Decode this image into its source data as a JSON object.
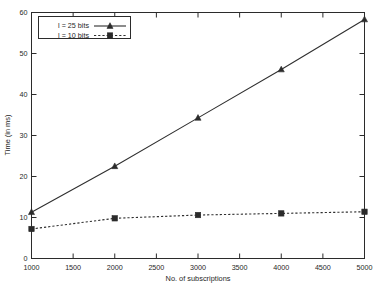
{
  "chart_data": {
    "type": "line",
    "title": "",
    "subtitle": "",
    "xlabel": "No. of subscriptions",
    "ylabel": "Time (in ms)",
    "xlim": [
      1000,
      5000
    ],
    "ylim": [
      0,
      60
    ],
    "x": [
      1000,
      2000,
      3000,
      4000,
      5000
    ],
    "xticks": [
      1000,
      1500,
      2000,
      2500,
      3000,
      3500,
      4000,
      4500,
      5000
    ],
    "xtick_labels": [
      "1000",
      "1500",
      "2000",
      "2500",
      "3000",
      "3500",
      "4000",
      "4500",
      "5000"
    ],
    "yticks": [
      0,
      10,
      20,
      30,
      40,
      50,
      60
    ],
    "ytick_labels": [
      "0",
      "10",
      "20",
      "30",
      "40",
      "50",
      "60"
    ],
    "grid": false,
    "legend_position": "top-left inside plot",
    "series": [
      {
        "name": "l = 25 bits",
        "values": [
          11.3,
          22.5,
          34.3,
          46.1,
          58.3
        ],
        "line_style": "solid",
        "marker": "triangle",
        "color": "#2b2b2b"
      },
      {
        "name": "l = 10 bits",
        "values": [
          7.2,
          9.8,
          10.6,
          11.0,
          11.4
        ],
        "line_style": "dashed",
        "marker": "square",
        "color": "#2b2b2b"
      }
    ]
  },
  "legend": {
    "entries": [
      {
        "label": "l = 25 bits"
      },
      {
        "label": "l = 10 bits"
      }
    ]
  },
  "axes": {
    "x_title": "No. of subscriptions",
    "y_title": "Time (in ms)"
  },
  "colors": {
    "background": "#ffffff",
    "foreground": "#2b2b2b",
    "series": "#2b2b2b"
  }
}
